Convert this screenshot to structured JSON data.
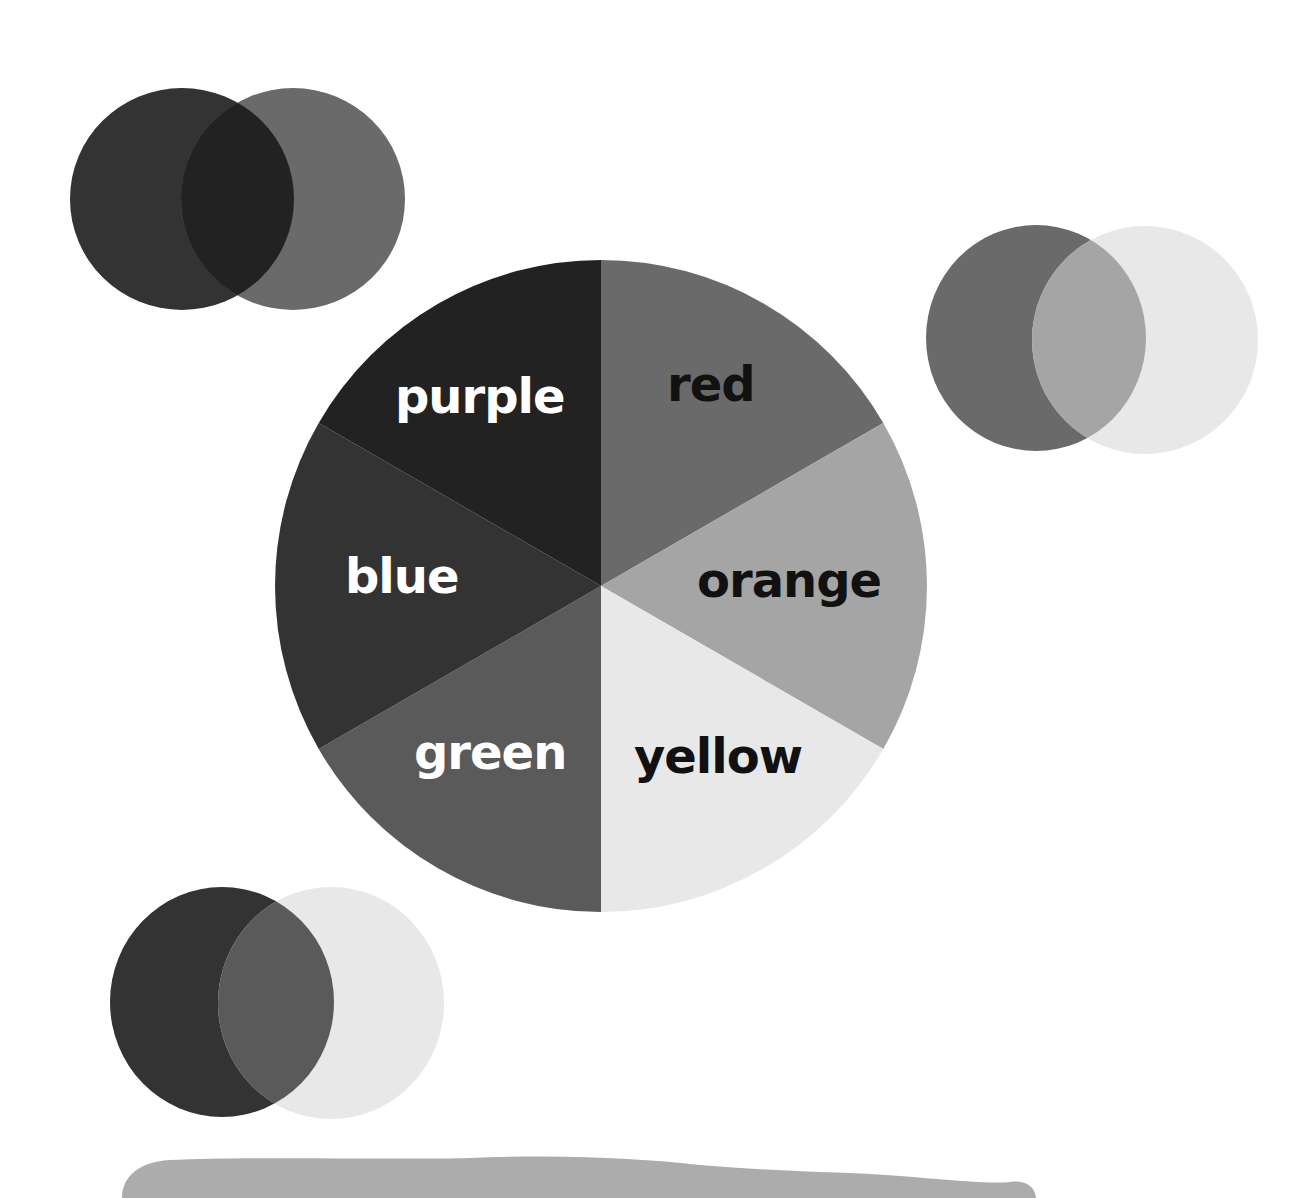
{
  "color_wheel": {
    "center": {
      "x": 601,
      "y": 586
    },
    "radius": 326,
    "segments": [
      {
        "name": "red",
        "label": "red",
        "color": "#6a6a6a",
        "label_color": "dark"
      },
      {
        "name": "orange",
        "label": "orange",
        "color": "#a5a5a5",
        "label_color": "dark"
      },
      {
        "name": "yellow",
        "label": "yellow",
        "color": "#e8e8e8",
        "label_color": "dark"
      },
      {
        "name": "green",
        "label": "green",
        "color": "#5a5a5a",
        "label_color": "light"
      },
      {
        "name": "blue",
        "label": "blue",
        "color": "#333333",
        "label_color": "light"
      },
      {
        "name": "purple",
        "label": "purple",
        "color": "#222222",
        "label_color": "light"
      }
    ]
  },
  "venn_pairs": [
    {
      "name": "blue-red-makes-purple",
      "left": {
        "color_name": "blue",
        "color": "#333333"
      },
      "right": {
        "color_name": "red",
        "color": "#6a6a6a"
      },
      "overlap": {
        "color_name": "purple",
        "color": "#222222"
      }
    },
    {
      "name": "red-yellow-makes-orange",
      "left": {
        "color_name": "red",
        "color": "#6a6a6a"
      },
      "right": {
        "color_name": "yellow",
        "color": "#e8e8e8"
      },
      "overlap": {
        "color_name": "orange",
        "color": "#a5a5a5"
      }
    },
    {
      "name": "blue-yellow-makes-green",
      "left": {
        "color_name": "blue",
        "color": "#333333"
      },
      "right": {
        "color_name": "yellow",
        "color": "#e8e8e8"
      },
      "overlap": {
        "color_name": "green",
        "color": "#5a5a5a"
      }
    }
  ],
  "bottom_banner": {
    "color": "#acacac"
  }
}
